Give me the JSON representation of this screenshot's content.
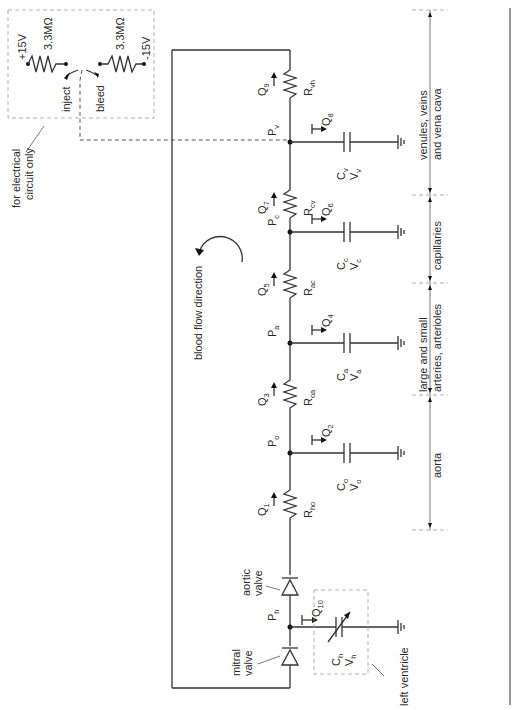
{
  "diagram": {
    "orientation": "rotated-90-ccw",
    "colors": {
      "line": "#333333",
      "dash": "#555555",
      "background": "#ffffff"
    },
    "electrical_inset": {
      "note": "for electrical circuit only",
      "note_line1": "for electrical",
      "note_line2": "circuit only",
      "positive_supply": "+15V",
      "negative_supply": "-15V",
      "resistor_left": "3.3MΩ",
      "resistor_right": "3.3MΩ",
      "switch_inject": "inject",
      "switch_bleed": "bleed"
    },
    "flow_label": "blood flow direction",
    "nodes": [
      {
        "id": "Pv",
        "base": "P",
        "sub": "v"
      },
      {
        "id": "Pc",
        "base": "P",
        "sub": "c"
      },
      {
        "id": "Pa",
        "base": "P",
        "sub": "a"
      },
      {
        "id": "Po",
        "base": "P",
        "sub": "o"
      },
      {
        "id": "Ph",
        "base": "P",
        "sub": "h"
      }
    ],
    "resistors": [
      {
        "id": "Rvh",
        "base": "R",
        "sub": "vh",
        "flow": {
          "base": "Q",
          "sub": "9"
        }
      },
      {
        "id": "Rcv",
        "base": "R",
        "sub": "cv",
        "flow": {
          "base": "Q",
          "sub": "7"
        }
      },
      {
        "id": "Rac",
        "base": "R",
        "sub": "ac",
        "flow": {
          "base": "Q",
          "sub": "5"
        }
      },
      {
        "id": "Roa",
        "base": "R",
        "sub": "oa",
        "flow": {
          "base": "Q",
          "sub": "3"
        }
      },
      {
        "id": "Rho",
        "base": "R",
        "sub": "ho",
        "flow": {
          "base": "Q",
          "sub": "1"
        }
      }
    ],
    "capacitors": [
      {
        "id": "Cv",
        "cap": {
          "base": "C",
          "sub": "v"
        },
        "vol": {
          "base": "V",
          "sub": "v"
        },
        "flow": {
          "base": "Q",
          "sub": "8"
        }
      },
      {
        "id": "Cc",
        "cap": {
          "base": "C",
          "sub": "c"
        },
        "vol": {
          "base": "V",
          "sub": "c"
        },
        "flow": {
          "base": "Q",
          "sub": "6"
        }
      },
      {
        "id": "Ca",
        "cap": {
          "base": "C",
          "sub": "a"
        },
        "vol": {
          "base": "V",
          "sub": "a"
        },
        "flow": {
          "base": "Q",
          "sub": "4"
        }
      },
      {
        "id": "Co",
        "cap": {
          "base": "C",
          "sub": "o"
        },
        "vol": {
          "base": "V",
          "sub": "o"
        },
        "flow": {
          "base": "Q",
          "sub": "2"
        }
      },
      {
        "id": "Ch",
        "cap": {
          "base": "C",
          "sub": "h"
        },
        "vol": {
          "base": "V",
          "sub": "h"
        },
        "flow": {
          "base": "Q",
          "sub": "10"
        },
        "variable": true
      }
    ],
    "valves": {
      "aortic_line1": "aortic",
      "aortic_line2": "valve",
      "mitral_line1": "mitral",
      "mitral_line2": "valve"
    },
    "regions": [
      {
        "id": "veins",
        "line1": "venules, veins",
        "line2": "and vena cava"
      },
      {
        "id": "capillaries",
        "line1": "capillaries",
        "line2": ""
      },
      {
        "id": "arteries",
        "line1": "large and small",
        "line2": "arteries, arterioles"
      },
      {
        "id": "aorta",
        "line1": "aorta",
        "line2": ""
      }
    ],
    "left_ventricle_label": "left ventricle"
  }
}
